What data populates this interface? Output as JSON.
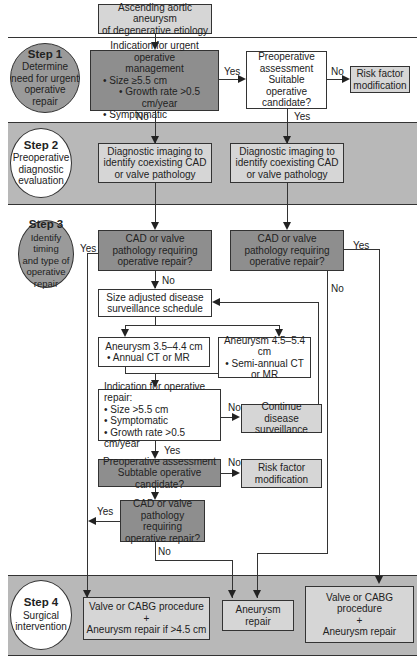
{
  "start": {
    "line1": "Ascending aortic aneurysm",
    "line2": "of degenerative etiology"
  },
  "steps": [
    {
      "title": "Step 1",
      "lines": [
        "Determine",
        "need for urgent",
        "operative",
        "repair"
      ]
    },
    {
      "title": "Step 2",
      "lines": [
        "Preoperative",
        "diagnostic",
        "evaluation"
      ]
    },
    {
      "title": "Step 3",
      "lines": [
        "Identify timing",
        "and type of",
        "operative",
        "repair"
      ]
    },
    {
      "title": "Step 4",
      "lines": [
        "Surgical",
        "intervention"
      ]
    }
  ],
  "step1": {
    "urgent": {
      "title1": "Indication for urgent operative",
      "title2": "management",
      "bullets": [
        "• Size ≥5.5 cm",
        "• Growth rate >0.5 cm/year",
        "• Symptomatic"
      ]
    },
    "preop": {
      "lines": [
        "Preoperative",
        "assessment",
        "Suitable operative",
        "candidate?"
      ]
    },
    "risk": {
      "lines": [
        "Risk factor",
        "modification"
      ]
    }
  },
  "step2": {
    "imaging_left": {
      "lines": [
        "Diagnostic imaging to",
        "identify coexisting CAD",
        "or valve pathology"
      ]
    },
    "imaging_right": {
      "lines": [
        "Diagnostic imaging to",
        "identify coexisting CAD",
        "or valve pathology"
      ]
    }
  },
  "step3": {
    "cad_left": {
      "lines": [
        "CAD or valve",
        "pathology requiring",
        "operative repair?"
      ]
    },
    "cad_right": {
      "lines": [
        "CAD or valve",
        "pathology requiring",
        "operative repair?"
      ]
    },
    "surveillance": {
      "lines": [
        "Size adjusted disease",
        "surveillance schedule"
      ]
    },
    "small": {
      "lines": [
        "Aneurysm 3.5–4.4 cm",
        "• Annual CT or MR"
      ]
    },
    "medium": {
      "lines": [
        "Aneurysm 4.5–5.4 cm",
        "• Semi-annual CT",
        "or MR"
      ]
    },
    "indication": {
      "title": "Indication for operative repair:",
      "bullets": [
        "• Size >5.5 cm",
        "• Symptomatic",
        "• Growth rate >0.5 cm/year"
      ]
    },
    "continue": {
      "lines": [
        "Continue disease",
        "surveillance"
      ]
    },
    "preop2": {
      "lines": [
        "Preoperative assessment",
        "Subtable operative candidate?"
      ]
    },
    "risk2": {
      "lines": [
        "Risk factor",
        "modification"
      ]
    },
    "cad3": {
      "lines": [
        "CAD or valve",
        "pathology requiring",
        "operative repair?"
      ]
    }
  },
  "step4": {
    "combo_left": {
      "lines": [
        "Valve or CABG procedure",
        "+",
        "Aneurysm repair if >4.5 cm"
      ]
    },
    "repair": {
      "lines": [
        "Aneurysm repair"
      ]
    },
    "combo_right": {
      "lines": [
        "Valve or CABG procedure",
        "+",
        "Aneurysm repair"
      ]
    }
  },
  "labels": {
    "yes": "Yes",
    "no": "No"
  }
}
